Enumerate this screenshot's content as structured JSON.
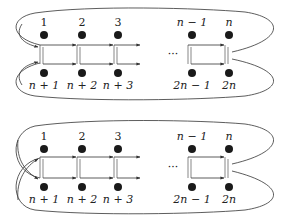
{
  "diagrams": [
    {
      "id": "top",
      "top_labels": [
        "1",
        "2",
        "3",
        "n − 1",
        "n"
      ],
      "bottom_labels": [
        "n + 1",
        "n + 2",
        "n + 3",
        "2n − 1",
        "2n"
      ],
      "ellipsis": "···",
      "left_connection": "separate loops (top arrow to top row, bottom arrow to bottom row)"
    },
    {
      "id": "bottom",
      "top_labels": [
        "1",
        "2",
        "3",
        "n − 1",
        "n"
      ],
      "bottom_labels": [
        "n + 1",
        "n + 2",
        "n + 3",
        "2n − 1",
        "2n"
      ],
      "ellipsis": "···",
      "left_connection": "crossed loops (top arrow to bottom row, bottom arrow to top row)"
    }
  ],
  "colors": {
    "ink": "#1a1a1a",
    "background": "#ffffff"
  }
}
